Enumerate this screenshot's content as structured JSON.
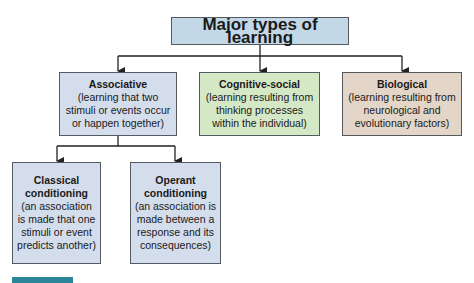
{
  "title": "Major types of learning",
  "categories": [
    {
      "name": "Associative",
      "description": "(learning that two stimuli or events occur or happen together)",
      "color": "#d4ddec"
    },
    {
      "name": "Cognitive-social",
      "description": "(learning resulting from thinking processes within the individual)",
      "color": "#d5e8c5"
    },
    {
      "name": "Biological",
      "description": "(learning resulting from neurological and evolutionary factors)",
      "color": "#e3d6c8"
    }
  ],
  "associative_subtypes": [
    {
      "name": "Classical conditioning",
      "description": "(an association is made that one stimuli or event predicts another)"
    },
    {
      "name": "Operant conditioning",
      "description": "(an association is made between a response and its consequences)"
    }
  ],
  "colors": {
    "title_box": "#c3d8e7",
    "connector": "#222222",
    "footer_bar": "#2b8797"
  }
}
